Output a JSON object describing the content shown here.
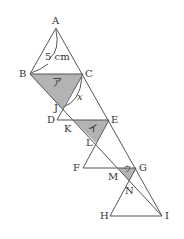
{
  "diagram": {
    "points": {
      "A": {
        "label": "A",
        "x": 56,
        "y": 28
      },
      "B": {
        "label": "B",
        "x": 30,
        "y": 74
      },
      "C": {
        "label": "C",
        "x": 83,
        "y": 74
      },
      "J": {
        "label": "J",
        "x": 62,
        "y": 109
      },
      "D": {
        "label": "D",
        "x": 57,
        "y": 120
      },
      "K": {
        "label": "K",
        "x": 73,
        "y": 120
      },
      "E": {
        "label": "E",
        "x": 109,
        "y": 120
      },
      "L": {
        "label": "L",
        "x": 96,
        "y": 143
      },
      "F": {
        "label": "F",
        "x": 83,
        "y": 168
      },
      "M": {
        "label": "M",
        "x": 118,
        "y": 168
      },
      "G": {
        "label": "G",
        "x": 136,
        "y": 168
      },
      "N": {
        "label": "N",
        "x": 129,
        "y": 181
      },
      "H": {
        "label": "H",
        "x": 110,
        "y": 216
      },
      "I": {
        "label": "I",
        "x": 162,
        "y": 216
      }
    },
    "length_label": "5 cm",
    "angle_label": "x",
    "regions": {
      "a": "ア",
      "i": "イ",
      "u": "ウ"
    },
    "colors": {
      "line": "#555555",
      "shade": "#b3b3b3",
      "text": "#333333"
    }
  }
}
